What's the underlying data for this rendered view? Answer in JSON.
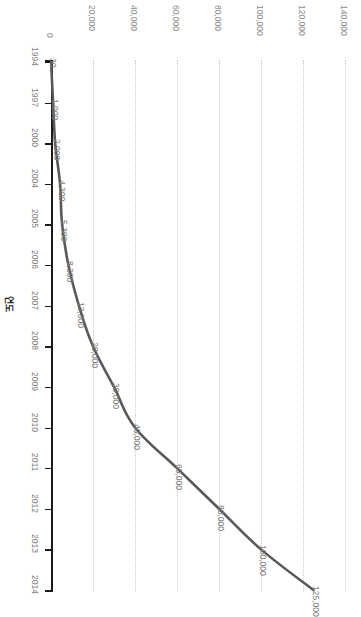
{
  "chart_data": {
    "type": "line",
    "title": "",
    "subtitle": "",
    "xlabel": "",
    "ylabel": "연도",
    "orientation": "horizontal-value-axis-top",
    "grid": true,
    "legend": false,
    "legend_position": "none",
    "line_color": "#595959",
    "grid_color": "#c9c9c9",
    "axis_color": "#1a1a1a",
    "label_color": "#7d7d7d",
    "value_axis": {
      "label": "",
      "min": 0,
      "max": 140000,
      "tick_step": 20000,
      "tick_labels": [
        "0",
        "20,000",
        "40,000",
        "60,000",
        "80,000",
        "100,000",
        "120,000",
        "140,000"
      ],
      "tick_values": [
        0,
        20000,
        40000,
        60000,
        80000,
        100000,
        120000,
        140000
      ]
    },
    "category_axis": {
      "label": "연도",
      "categories": [
        "1994",
        "1997",
        "2000",
        "2004",
        "2005",
        "2006",
        "2007",
        "2008",
        "2009",
        "2010",
        "2011",
        "2012",
        "2013",
        "2014"
      ]
    },
    "categories": [
      "1994",
      "1997",
      "2000",
      "2004",
      "2005",
      "2006",
      "2007",
      "2008",
      "2009",
      "2010",
      "2011",
      "2012",
      "2013",
      "2014"
    ],
    "values": [
      30,
      1000,
      2000,
      4300,
      5300,
      8300,
      13300,
      20000,
      30000,
      40000,
      60000,
      80000,
      100000,
      125000
    ],
    "data_labels": [
      "30",
      "1,000",
      "2,000",
      "4,300",
      "5,300",
      "8,300",
      "13,300",
      "20,000",
      "30,000",
      "40,000",
      "60,000",
      "80,000",
      "100,000",
      "125,000"
    ],
    "series": [
      {
        "name": "",
        "color": "#595959",
        "values": [
          30,
          1000,
          2000,
          4300,
          5300,
          8300,
          13300,
          20000,
          30000,
          40000,
          60000,
          80000,
          100000,
          125000
        ]
      }
    ]
  }
}
